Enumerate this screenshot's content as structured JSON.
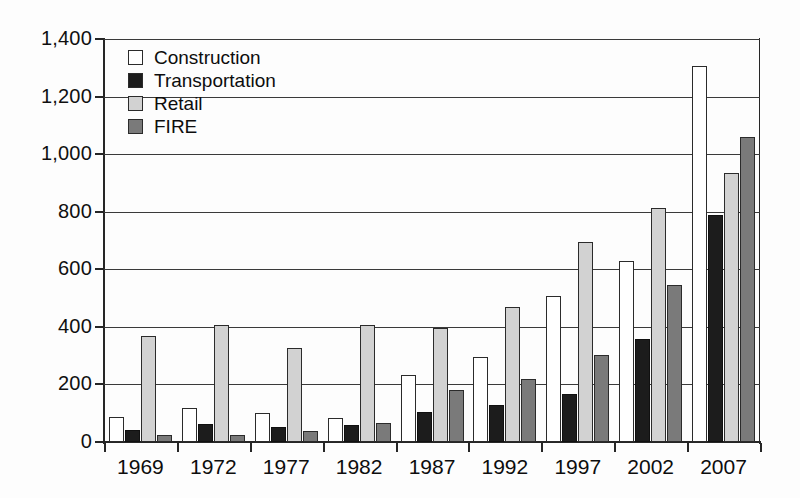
{
  "chart_data": {
    "type": "bar",
    "title": "",
    "subtitle": "",
    "xlabel": "",
    "ylabel": "",
    "categories": [
      "1969",
      "1972",
      "1977",
      "1982",
      "1987",
      "1992",
      "1997",
      "2002",
      "2007"
    ],
    "series": [
      {
        "name": "Construction",
        "color": "#ffffff",
        "values": [
          88,
          117,
          100,
          85,
          232,
          297,
          508,
          630,
          1305
        ]
      },
      {
        "name": "Transportation",
        "color": "#1c1c1c",
        "values": [
          43,
          62,
          53,
          58,
          105,
          127,
          167,
          358,
          790
        ]
      },
      {
        "name": "Retail",
        "color": "#d2d2d2",
        "values": [
          370,
          405,
          325,
          405,
          395,
          470,
          695,
          813,
          935
        ]
      },
      {
        "name": "FIRE",
        "color": "#7a7a7a",
        "values": [
          25,
          25,
          38,
          65,
          182,
          220,
          303,
          547,
          1060
        ]
      }
    ],
    "ylim": [
      0,
      1400
    ],
    "yticks": [
      0,
      200,
      400,
      600,
      800,
      1000,
      1200,
      1400
    ],
    "ytick_labels": [
      "0",
      "200",
      "400",
      "600",
      "800",
      "1,000",
      "1,200",
      "1,400"
    ],
    "grid": true,
    "legend_position": "top-left",
    "legend_entries": [
      "Construction",
      "Transportation",
      "Retail",
      "FIRE"
    ]
  }
}
